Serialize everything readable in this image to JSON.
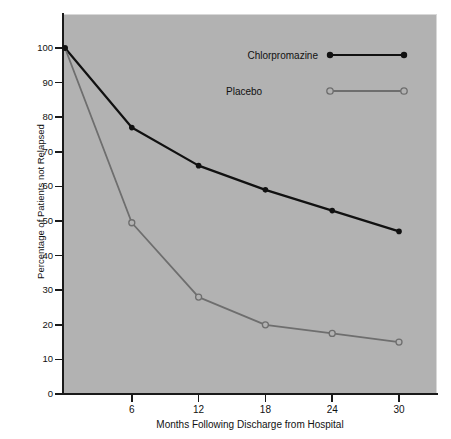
{
  "chart_data": {
    "type": "line",
    "title": "",
    "xlabel": "Months Following Discharge from Hospital",
    "ylabel": "Percentage of Patients not Relapsed",
    "x": [
      0,
      6,
      12,
      18,
      24,
      30
    ],
    "xlim": [
      0,
      33
    ],
    "ylim": [
      0,
      105
    ],
    "xticks": [
      6,
      12,
      18,
      24,
      30
    ],
    "xtick_labels": [
      "6",
      "12",
      "18",
      "24",
      "30"
    ],
    "yticks": [
      0,
      10,
      20,
      30,
      40,
      50,
      60,
      70,
      80,
      90,
      100
    ],
    "ytick_labels": [
      "0",
      "10",
      "20",
      "30",
      "40",
      "50",
      "60",
      "70",
      "80",
      "90",
      "100"
    ],
    "grid": false,
    "legend_position": "upper right inside",
    "plot_background": "#b2b2b2",
    "series": [
      {
        "name": "Chlorpromazine",
        "color": "#111111",
        "marker": "filled-circle",
        "values": [
          100,
          77,
          66,
          59,
          53,
          47
        ]
      },
      {
        "name": "Placebo",
        "color": "#6e6e6e",
        "marker": "open-circle",
        "values": [
          100,
          49.5,
          28,
          20,
          17.5,
          15
        ]
      }
    ]
  },
  "legend": {
    "items": [
      {
        "label": "Chlorpromazine",
        "marker": "filled-circle",
        "color": "#111111"
      },
      {
        "label": "Placebo",
        "marker": "open-circle",
        "color": "#6e6e6e"
      }
    ]
  }
}
